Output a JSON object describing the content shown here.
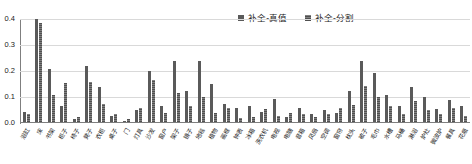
{
  "chart_data": {
    "type": "bar",
    "title": "",
    "subtitle": "",
    "xlabel": "",
    "ylabel": "",
    "ylim": [
      0.0,
      0.4
    ],
    "yticks": [
      "0.0",
      "0.1",
      "0.2",
      "0.3",
      "0.4"
    ],
    "ytick_values": [
      0.0,
      0.1,
      0.2,
      0.3,
      0.4
    ],
    "grid": true,
    "legend_position": "top-right",
    "colors": {
      "series_0": "#5a5a5a",
      "series_1": "#808080",
      "gridline": "#d9d9d9",
      "axis": "#7f7f7f",
      "text": "#1a1a1a",
      "background": "#ffffff"
    },
    "categories": [
      "浴缸",
      "床",
      "书架",
      "柜子",
      "椅子",
      "凳子",
      "衣柜",
      "桌子",
      "门",
      "灯具",
      "沙发",
      "窗户",
      "架子",
      "镜子",
      "地毯",
      "植物",
      "画框",
      "钟表",
      "冰箱",
      "洗衣机",
      "电视",
      "电脑",
      "音箱",
      "风扇",
      "空调",
      "窗帘",
      "枕头",
      "被子",
      "毛巾",
      "水槽",
      "马桶",
      "淋浴",
      "炉灶",
      "微波炉",
      "餐具",
      "花瓶"
    ],
    "series": [
      {
        "name": "补全-真值",
        "color": "#5a5a5a",
        "values": [
          0.04,
          0.395,
          0.205,
          0.06,
          0.012,
          0.215,
          0.135,
          0.025,
          0.005,
          0.045,
          0.195,
          0.06,
          0.235,
          0.12,
          0.235,
          0.145,
          0.07,
          0.055,
          0.06,
          0.04,
          0.09,
          0.02,
          0.055,
          0.03,
          0.045,
          0.035,
          0.12,
          0.235,
          0.19,
          0.105,
          0.06,
          0.135,
          0.095,
          0.05,
          0.085,
          0.06
        ]
      },
      {
        "name": "补全-分割",
        "color": "#808080",
        "values": [
          0.03,
          0.38,
          0.105,
          0.15,
          0.02,
          0.155,
          0.07,
          0.03,
          0.01,
          0.055,
          0.16,
          0.035,
          0.11,
          0.06,
          0.095,
          0.035,
          0.055,
          0.015,
          0.02,
          0.05,
          0.025,
          0.035,
          0.03,
          0.02,
          0.03,
          0.055,
          0.065,
          0.14,
          0.095,
          0.06,
          0.03,
          0.08,
          0.045,
          0.03,
          0.055,
          0.025
        ]
      }
    ]
  },
  "legend": {
    "entries": [
      {
        "label": "补全-真值",
        "color": "#5a5a5a"
      },
      {
        "label": "补全-分割",
        "color": "#808080"
      }
    ]
  }
}
